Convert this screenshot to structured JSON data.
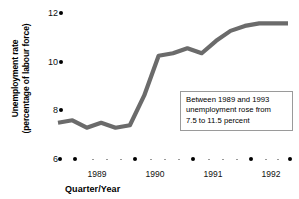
{
  "chart_data": {
    "type": "line",
    "title": "",
    "xlabel": "Quarter/Year",
    "ylabel": "Unemployment rate (percentage of labour force)",
    "ylim": [
      6,
      12
    ],
    "yticks": [
      6,
      8,
      10,
      12
    ],
    "ytick_labels": [
      "6",
      "8",
      "10",
      "12"
    ],
    "grid": false,
    "legend": "none",
    "line_color": "#6b6b6b",
    "x_year_labels": [
      "1989",
      "1990",
      "1991",
      "1992"
    ],
    "x": [
      "1988 Q4",
      "1989 Q1",
      "1989 Q2",
      "1989 Q3",
      "1989 Q4",
      "1990 Q1",
      "1990 Q2",
      "1990 Q3",
      "1990 Q4",
      "1991 Q1",
      "1991 Q2",
      "1991 Q3",
      "1991 Q4",
      "1992 Q1",
      "1992 Q2",
      "1992 Q3",
      "1992 Q4"
    ],
    "values": [
      7.5,
      7.6,
      7.3,
      7.5,
      7.3,
      7.4,
      8.6,
      10.2,
      10.3,
      10.5,
      10.3,
      10.8,
      11.2,
      11.4,
      11.5,
      11.5,
      11.5
    ],
    "annotations": [
      {
        "name": "callout",
        "lines": [
          "Between 1989 and 1993",
          "unemployment rose from",
          "7.5 to 11.5 percent"
        ]
      }
    ]
  },
  "axis": {
    "ylabel_line1": "Unemployment rate",
    "ylabel_line2": "(percentage of labour force)",
    "xlabel": "Quarter/Year",
    "ytick_0": "6",
    "ytick_1": "8",
    "ytick_2": "10",
    "ytick_3": "12",
    "xyear_0": "1989",
    "xyear_1": "1990",
    "xyear_2": "1991",
    "xyear_3": "1992"
  },
  "callout": {
    "line1": "Between 1989 and 1993",
    "line2": "unemployment rose from",
    "line3": "7.5 to 11.5 percent"
  }
}
